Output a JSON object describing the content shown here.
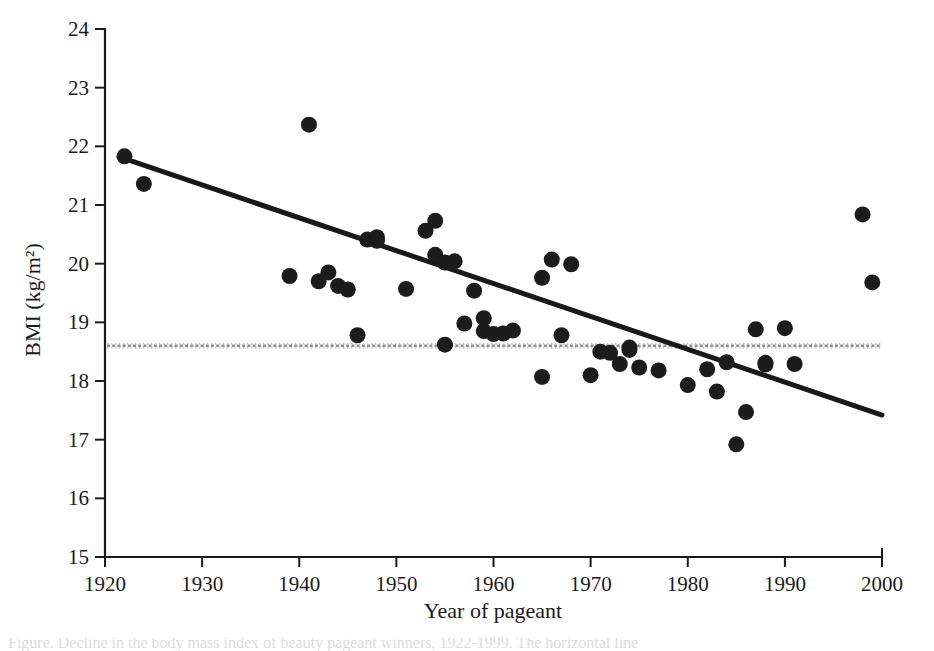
{
  "figure": {
    "caption_partial": "Figure. Decline in the body mass index of beauty pageant winners, 1922-1999. The horizontal line",
    "xaxis_title": "Year of pageant",
    "yaxis_title": "BMI (kg/m²)"
  },
  "chart_data": {
    "type": "scatter",
    "title": "",
    "xlabel": "Year of pageant",
    "ylabel": "BMI (kg/m²)",
    "xlim": [
      1920,
      2000
    ],
    "ylim": [
      15,
      24
    ],
    "xticks": [
      1920,
      1930,
      1940,
      1950,
      1960,
      1970,
      1980,
      1990,
      2000
    ],
    "yticks": [
      15,
      16,
      17,
      18,
      19,
      20,
      21,
      22,
      23,
      24
    ],
    "grid": false,
    "legend": "none",
    "x": [
      1922,
      1924,
      1939,
      1941,
      1942,
      1943,
      1944,
      1945,
      1946,
      1947,
      1948,
      1948,
      1951,
      1953,
      1954,
      1954,
      1955,
      1955,
      1956,
      1957,
      1958,
      1959,
      1959,
      1960,
      1961,
      1962,
      1965,
      1965,
      1966,
      1967,
      1968,
      1970,
      1971,
      1972,
      1973,
      1974,
      1974,
      1975,
      1977,
      1980,
      1982,
      1983,
      1984,
      1985,
      1986,
      1987,
      1988,
      1988,
      1990,
      1991,
      1998,
      1999
    ],
    "y": [
      21.83,
      21.36,
      19.79,
      22.37,
      19.7,
      19.85,
      19.62,
      19.56,
      18.78,
      20.41,
      20.45,
      20.39,
      19.57,
      20.56,
      20.73,
      20.15,
      18.62,
      20.02,
      20.04,
      18.98,
      19.54,
      19.07,
      18.85,
      18.8,
      18.81,
      18.86,
      18.07,
      19.76,
      20.07,
      18.78,
      19.99,
      18.1,
      18.5,
      18.48,
      18.29,
      18.53,
      18.57,
      18.23,
      18.18,
      17.93,
      18.2,
      17.82,
      18.32,
      16.92,
      17.47,
      18.88,
      18.28,
      18.31,
      18.9,
      18.29,
      20.84,
      19.68
    ],
    "trend_line": {
      "name": "linear regression of BMI on year",
      "x": [
        1922,
        2000
      ],
      "y": [
        21.79,
        17.42
      ],
      "style": "solid",
      "color": "#191919"
    },
    "reference_line": {
      "name": "underweight threshold",
      "y": 18.6,
      "x_range": [
        1920,
        2000
      ],
      "style": "dotted",
      "color": "#8d8d8d"
    },
    "marker": {
      "shape": "circle",
      "color": "#1c1c1c",
      "size": 9
    }
  }
}
